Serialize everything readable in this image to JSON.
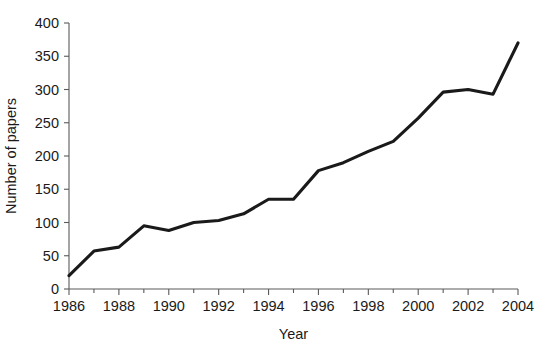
{
  "chart_data": {
    "type": "line",
    "title": "",
    "xlabel": "Year",
    "ylabel": "Number of papers",
    "xlim": [
      1986,
      2004
    ],
    "ylim": [
      0,
      400
    ],
    "grid": false,
    "legend": null,
    "x": [
      1986,
      1987,
      1988,
      1989,
      1990,
      1991,
      1992,
      1993,
      1994,
      1995,
      1996,
      1997,
      1998,
      1999,
      2000,
      2001,
      2002,
      2003,
      2004
    ],
    "values": [
      20,
      57,
      63,
      95,
      88,
      100,
      103,
      113,
      135,
      135,
      178,
      190,
      207,
      222,
      257,
      296,
      300,
      293,
      370
    ],
    "series": [
      {
        "name": "Number of papers",
        "color": "#1a1a1a",
        "values": [
          20,
          57,
          63,
          95,
          88,
          100,
          103,
          113,
          135,
          135,
          178,
          190,
          207,
          222,
          257,
          296,
          300,
          293,
          370
        ]
      }
    ],
    "y_ticks": [
      0,
      50,
      100,
      150,
      200,
      250,
      300,
      350,
      400
    ],
    "y_tick_labels": [
      "0",
      "50",
      "100",
      "150",
      "200",
      "250",
      "300",
      "350",
      "400"
    ],
    "x_ticks": [
      1986,
      1988,
      1990,
      1992,
      1994,
      1996,
      1998,
      2000,
      2002,
      2004
    ],
    "x_tick_labels": [
      "1986",
      "1988",
      "1990",
      "1992",
      "1994",
      "1996",
      "1998",
      "2000",
      "2002",
      "2004"
    ],
    "x_minor_ticks": [
      1987,
      1989,
      1991,
      1993,
      1995,
      1997,
      1999,
      2001,
      2003
    ],
    "colors": {
      "line": "#1a1a1a",
      "axis": "#5a5a5a",
      "text": "#1a1a1a",
      "background": "#ffffff"
    }
  }
}
